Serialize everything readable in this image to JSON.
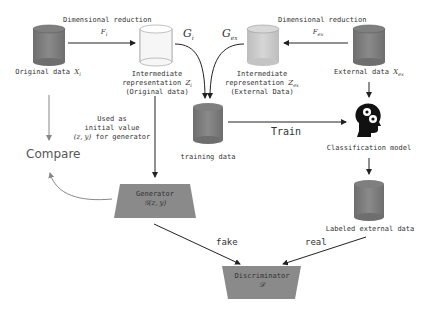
{
  "nodes": {
    "original_data": {
      "label": "Original data",
      "symbol": "X",
      "sub": "i"
    },
    "intermediate_original": {
      "line1": "Intermediate",
      "line2": "representation",
      "symbol": "Z",
      "sub": "i",
      "line3": "(Original data)"
    },
    "intermediate_external": {
      "line1": "Intermediate",
      "line2": "representation",
      "symbol": "Z",
      "sub": "ex",
      "line3": "(External Data)"
    },
    "external_data": {
      "label": "External data",
      "symbol": "X",
      "sub": "ex"
    },
    "training_data": {
      "label": "training data"
    },
    "classification_model": {
      "label": "Classification model"
    },
    "labeled_external_data": {
      "label": "Labeled external data"
    },
    "compare": {
      "label": "Compare"
    },
    "generator": {
      "title": "Generator",
      "formula": "𝒢(z, y)"
    },
    "discriminator": {
      "title": "Discriminator",
      "formula": "𝒟"
    }
  },
  "edges": {
    "dim_reduction_left": {
      "label": "Dimensional reduction",
      "func": "F",
      "sub": "i"
    },
    "dim_reduction_right": {
      "label": "Dimensional reduction",
      "func": "F",
      "sub": "ex"
    },
    "g_i": {
      "label": "G",
      "sub": "i"
    },
    "g_ex": {
      "label": "G",
      "sub": "ex"
    },
    "train": {
      "label": "Train"
    },
    "used_as": {
      "line1": "Used as",
      "line2": "initial value",
      "line3_math": "(z, y)",
      "line3_text": " for generator"
    },
    "fake": {
      "label": "fake"
    },
    "real": {
      "label": "real"
    }
  },
  "colors": {
    "cylinder_dark": "#7d7d7d",
    "cylinder_light": "#f2f2f2",
    "cylinder_mid": "#c9c9c9",
    "trapezoid": "#8a8a8a",
    "arrow": "#222222",
    "arrow_gray": "#888888"
  }
}
